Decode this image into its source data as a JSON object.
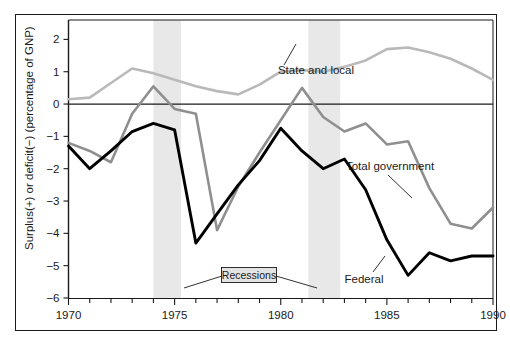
{
  "chart_data": {
    "type": "line",
    "title": "",
    "xlabel": "",
    "ylabel": "Surplus(+) or deficit(−) (percentage of GNP)",
    "xlim": [
      1970,
      1990
    ],
    "ylim": [
      -6,
      2.6
    ],
    "xticks": [
      1970,
      1971,
      1972,
      1973,
      1974,
      1975,
      1976,
      1977,
      1978,
      1979,
      1980,
      1981,
      1982,
      1983,
      1984,
      1985,
      1986,
      1987,
      1988,
      1989,
      1990
    ],
    "xtick_labels_shown": [
      "1970",
      "1975",
      "1980",
      "1985",
      "1990"
    ],
    "yticks": [
      2,
      1,
      0,
      -1,
      -2,
      -3,
      -4,
      -5,
      -6
    ],
    "ytick_labels": [
      "2",
      "1",
      "0",
      "−1",
      "−2",
      "−3",
      "−4",
      "−5",
      "−6"
    ],
    "grid": false,
    "zero_line": true,
    "legend_position": "inline-annotations",
    "x": [
      1970,
      1971,
      1972,
      1973,
      1974,
      1975,
      1976,
      1977,
      1978,
      1979,
      1980,
      1981,
      1982,
      1983,
      1984,
      1985,
      1986,
      1987,
      1988,
      1989,
      1990
    ],
    "series": [
      {
        "name": "State and local",
        "color": "#b9b9b9",
        "values": [
          0.15,
          0.2,
          0.65,
          1.1,
          0.95,
          0.75,
          0.55,
          0.4,
          0.3,
          0.6,
          1.0,
          1.05,
          1.0,
          1.15,
          1.35,
          1.7,
          1.75,
          1.6,
          1.4,
          1.1,
          0.75
        ]
      },
      {
        "name": "Total government",
        "color": "#8f8f8f",
        "values": [
          -1.2,
          -1.45,
          -1.8,
          -0.3,
          0.55,
          -0.15,
          -0.3,
          -3.9,
          -2.55,
          -1.5,
          -0.5,
          0.5,
          -0.4,
          -0.85,
          -0.6,
          -1.25,
          -1.15,
          -2.6,
          -3.7,
          -3.85,
          -3.2
        ],
        "ordered_note": "values plotted in year order 1970..1990"
      },
      {
        "name": "Federal",
        "color": "#000000",
        "values": [
          -1.3,
          -2.0,
          -1.45,
          -0.85,
          -0.6,
          -0.8,
          -4.3,
          -3.4,
          -2.5,
          -1.75,
          -0.75,
          -1.45,
          -2.0,
          -1.7,
          -2.65,
          -4.2,
          -5.3,
          -4.6,
          -4.85,
          -4.7,
          -4.7
        ]
      }
    ],
    "recessions": [
      {
        "label": "Recessions",
        "start": 1974.0,
        "end": 1975.3
      },
      {
        "label": "Recessions",
        "start": 1981.3,
        "end": 1982.8
      }
    ],
    "recession_band_color": "#e8e8e8",
    "annotations": [
      {
        "text": "State and local",
        "x": 1979.1,
        "y": 0.78
      },
      {
        "text": "Total government",
        "x": 1984.9,
        "y": -1.78
      },
      {
        "text": "Federal",
        "x": 1985.4,
        "y": -5.15
      },
      {
        "text": "Recessions",
        "x": 1976.9,
        "y": -5.25
      }
    ]
  },
  "axes": {
    "y_axis_title": "Surplus(+) or deficit(−) (percentage of GNP)",
    "y_tick_labels": [
      "2",
      "1",
      "0",
      "−1",
      "−2",
      "−3",
      "−4",
      "−5",
      "−6"
    ],
    "x_tick_labels": [
      "1970",
      "1975",
      "1980",
      "1985",
      "1990"
    ]
  },
  "labels": {
    "state_and_local": "State and local",
    "total_government": "Total government",
    "federal": "Federal",
    "recessions": "Recessions"
  },
  "colors": {
    "state_and_local": "#b9b9b9",
    "total_government": "#8f8f8f",
    "federal": "#000000",
    "recession_band": "#e8e8e8",
    "axis": "#1a1a1a",
    "background": "#ffffff"
  }
}
